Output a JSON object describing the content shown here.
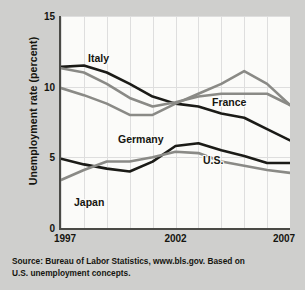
{
  "figure": {
    "y_axis_title": "Unemployment rate (percent)",
    "source_line1": "Source: Bureau of Labor Statistics, www.bls.gov. Based on",
    "source_line2": "U.S. unemployment concepts."
  },
  "labels": {
    "italy": "Italy",
    "germany": "Germany",
    "france": "France",
    "us": "U.S.",
    "japan": "Japan"
  },
  "ticks": {
    "y": [
      "15",
      "10",
      "5",
      "0"
    ],
    "x": [
      "1997",
      "2002",
      "2007"
    ]
  },
  "colors": {
    "dark_line": "#1b1b17",
    "gray_line": "#8a8a86",
    "axis": "#4a4a46",
    "grid": "#dedede",
    "plot_bg": "#fbfbf9",
    "page_bg": "#cfcfcd"
  },
  "chart_data": {
    "type": "line",
    "title": "",
    "xlabel": "",
    "ylabel": "Unemployment rate (percent)",
    "xlim": [
      1997,
      2007
    ],
    "ylim": [
      0,
      15
    ],
    "yticks": [
      0,
      5,
      10,
      15
    ],
    "xticks": [
      1997,
      2002,
      2007
    ],
    "grid": "vertical and horizontal, light gray",
    "legend": "inline series labels on plot",
    "x": [
      1997,
      1998,
      1999,
      2000,
      2001,
      2002,
      2003,
      2004,
      2005,
      2006,
      2007
    ],
    "series": [
      {
        "name": "Italy",
        "color": "#1b1b17",
        "values": [
          11.4,
          11.5,
          11.0,
          10.2,
          9.3,
          8.8,
          8.6,
          8.1,
          7.8,
          7.0,
          6.2
        ]
      },
      {
        "name": "Germany",
        "color": "#8a8a86",
        "values": [
          9.9,
          9.4,
          8.8,
          8.0,
          8.0,
          8.8,
          9.5,
          10.2,
          11.1,
          10.2,
          8.7
        ]
      },
      {
        "name": "France",
        "color": "#8a8a86",
        "values": [
          11.3,
          11.0,
          10.2,
          9.2,
          8.6,
          8.9,
          9.3,
          9.5,
          9.5,
          9.5,
          8.7
        ]
      },
      {
        "name": "U.S.",
        "color": "#1b1b17",
        "values": [
          4.9,
          4.5,
          4.2,
          4.0,
          4.7,
          5.8,
          6.0,
          5.5,
          5.1,
          4.6,
          4.6
        ]
      },
      {
        "name": "Japan",
        "color": "#8a8a86",
        "values": [
          3.4,
          4.1,
          4.7,
          4.7,
          5.0,
          5.4,
          5.3,
          4.7,
          4.4,
          4.1,
          3.9
        ]
      }
    ]
  }
}
